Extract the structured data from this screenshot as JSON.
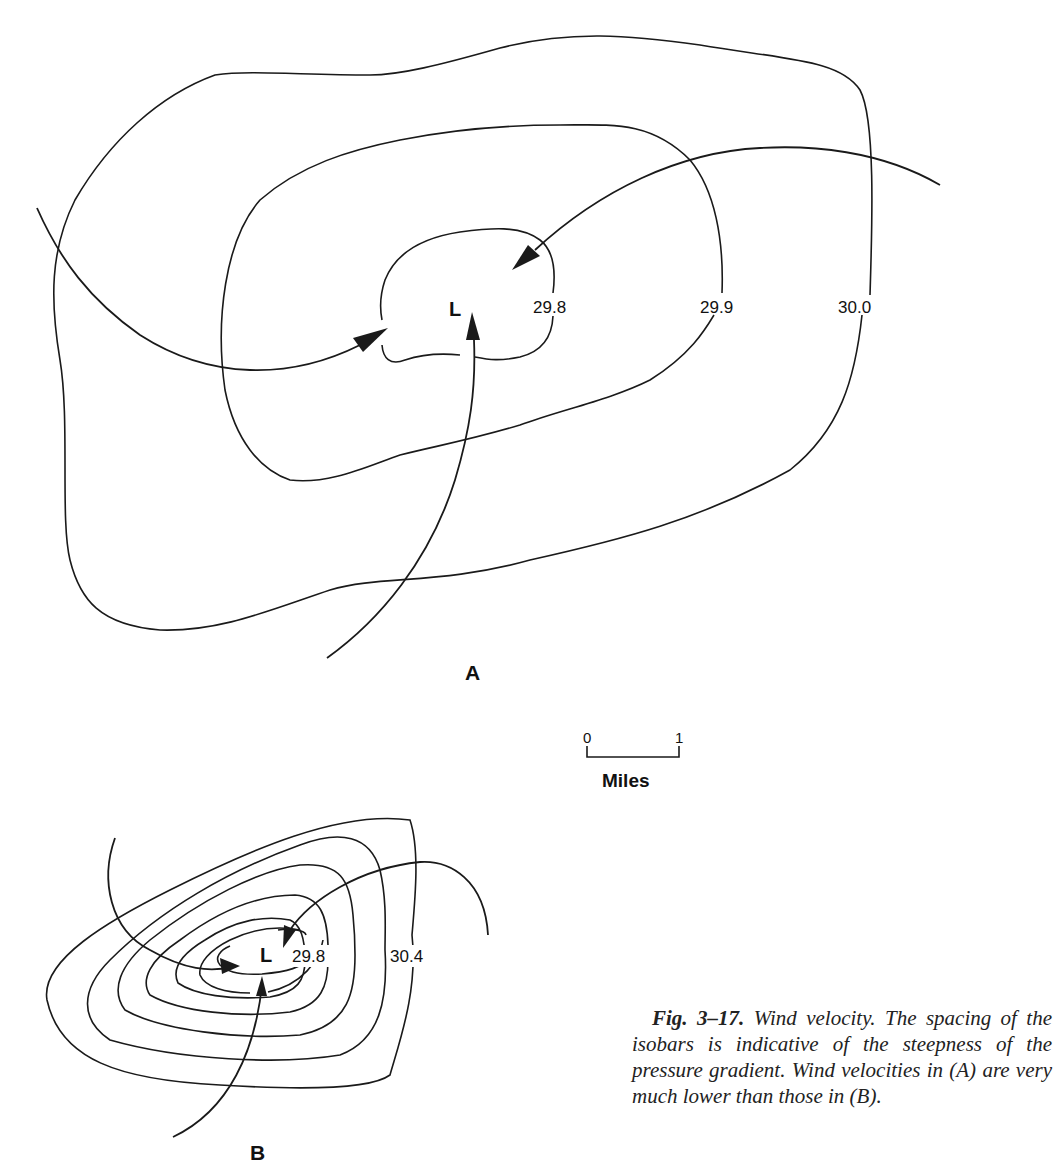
{
  "figure": {
    "number": "Fig. 3–17.",
    "caption": "Wind velocity. The spacing of the isobars is indicative of the steepness of the pressure gradient. Wind velocities in (A) are very much lower than those in (B).",
    "colors": {
      "ink": "#1a1a1a",
      "background": "#ffffff"
    }
  },
  "panel_a": {
    "label": "A",
    "low_center": "L",
    "isobars": [
      {
        "value": "29.8",
        "label": "29.8"
      },
      {
        "value": "29.9",
        "label": "29.9"
      },
      {
        "value": "30.0",
        "label": "30.0"
      }
    ],
    "wind_arrows": [
      "from-west",
      "from-northeast",
      "from-south"
    ]
  },
  "panel_b": {
    "label": "B",
    "low_center": "L",
    "isobar_count": 7,
    "labeled_isobars": [
      {
        "value": "29.8",
        "label": "29.8"
      },
      {
        "value": "30.4",
        "label": "30.4"
      }
    ],
    "wind_arrows": [
      "from-west",
      "from-northeast",
      "from-south"
    ]
  },
  "scale_bar": {
    "start": "0",
    "end": "1",
    "unit": "Miles"
  }
}
